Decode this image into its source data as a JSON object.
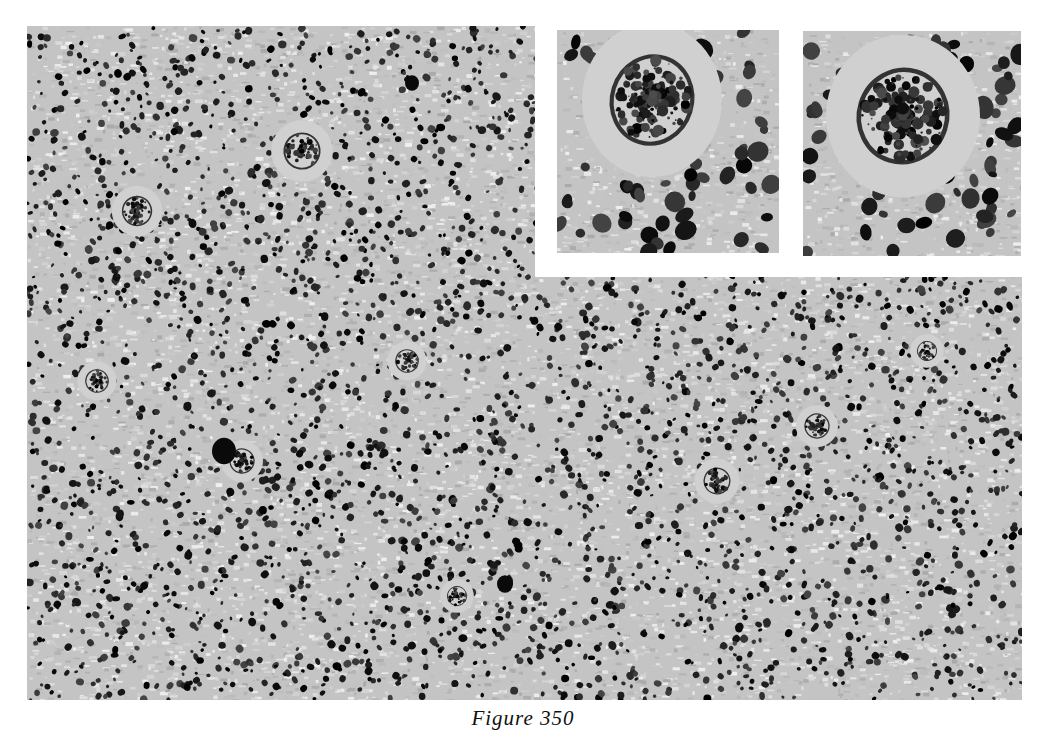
{
  "figure": {
    "caption": "Figure 350",
    "type": "histology micrograph, black and white",
    "main_panel": {
      "large_cells": [
        {
          "x": 275,
          "y": 125,
          "r": 22
        },
        {
          "x": 110,
          "y": 185,
          "r": 18
        },
        {
          "x": 70,
          "y": 355,
          "r": 14
        },
        {
          "x": 380,
          "y": 335,
          "r": 14
        },
        {
          "x": 690,
          "y": 455,
          "r": 16
        },
        {
          "x": 790,
          "y": 400,
          "r": 15
        },
        {
          "x": 215,
          "y": 435,
          "r": 15
        },
        {
          "x": 430,
          "y": 570,
          "r": 12
        },
        {
          "x": 900,
          "y": 325,
          "r": 12
        }
      ],
      "mitotic_figures": [
        {
          "x": 197,
          "y": 425,
          "r": 12
        },
        {
          "x": 478,
          "y": 558,
          "r": 8
        },
        {
          "x": 385,
          "y": 57,
          "r": 7
        }
      ]
    },
    "insets": [
      {
        "name": "inset-left",
        "giant_cell": {
          "x": 95,
          "y": 70,
          "rx": 50,
          "ry": 55
        }
      },
      {
        "name": "inset-right",
        "giant_cell": {
          "x": 100,
          "y": 85,
          "rx": 55,
          "ry": 58
        }
      }
    ]
  }
}
